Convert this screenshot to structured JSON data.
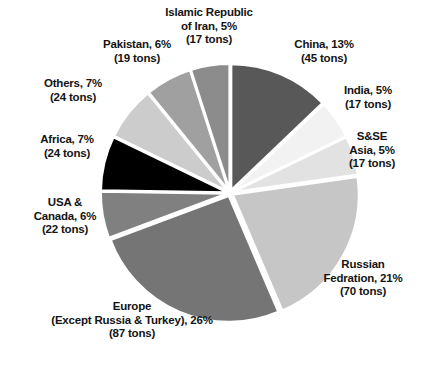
{
  "chart_data": {
    "type": "pie",
    "title": "",
    "subtitle": "",
    "xlabel": "",
    "ylabel": "",
    "legend_position": "none",
    "grid": false,
    "start_angle_deg": 0,
    "direction": "clockwise",
    "unit": "tons",
    "categories": [
      "China",
      "India",
      "S&SE Asia",
      "Russian Fedration",
      "Europe (Except Russia & Turkey)",
      "USA & Canada",
      "Africa",
      "Others",
      "Pakistan",
      "Islamic Republic of Iran"
    ],
    "values": [
      13,
      5,
      5,
      21,
      26,
      6,
      7,
      7,
      6,
      5
    ],
    "tons": [
      45,
      17,
      17,
      70,
      87,
      22,
      24,
      24,
      19,
      17
    ],
    "colors": [
      "#585858",
      "#f2f2f2",
      "#e2e2e2",
      "#c6c6c6",
      "#757575",
      "#808080",
      "#000000",
      "#cccccc",
      "#a0a0a0",
      "#8c8c8c"
    ],
    "slices": [
      {
        "name": "China",
        "percent": 13,
        "tons": 45,
        "color": "#585858",
        "label": "China, 13%\n(45 tons)"
      },
      {
        "name": "India",
        "percent": 5,
        "tons": 17,
        "color": "#f2f2f2",
        "label": "India, 5%\n(17 tons)"
      },
      {
        "name": "S&SE Asia",
        "percent": 5,
        "tons": 17,
        "color": "#e2e2e2",
        "label": "S&SE\nAsia, 5%\n(17 tons)"
      },
      {
        "name": "Russian Fedration",
        "percent": 21,
        "tons": 70,
        "color": "#c6c6c6",
        "label": "Russian\nFedration, 21%\n(70 tons)"
      },
      {
        "name": "Europe (Except Russia & Turkey)",
        "percent": 26,
        "tons": 87,
        "color": "#757575",
        "label": "Europe\n(Except Russia & Turkey), 26%\n(87 tons)"
      },
      {
        "name": "USA & Canada",
        "percent": 6,
        "tons": 22,
        "color": "#808080",
        "label": "USA &\nCanada, 6%\n(22 tons)"
      },
      {
        "name": "Africa",
        "percent": 7,
        "tons": 24,
        "color": "#000000",
        "label": "Africa, 7%\n(24 tons)"
      },
      {
        "name": "Others",
        "percent": 7,
        "tons": 24,
        "color": "#cccccc",
        "label": "Others, 7%\n(24 tons)"
      },
      {
        "name": "Pakistan",
        "percent": 6,
        "tons": 19,
        "color": "#a0a0a0",
        "label": "Pakistan, 6%\n(19 tons)"
      },
      {
        "name": "Islamic Republic of Iran",
        "percent": 5,
        "tons": 17,
        "color": "#8c8c8c",
        "label": "Islamic Republic\nof Iran, 5%\n(17 tons)"
      }
    ]
  }
}
